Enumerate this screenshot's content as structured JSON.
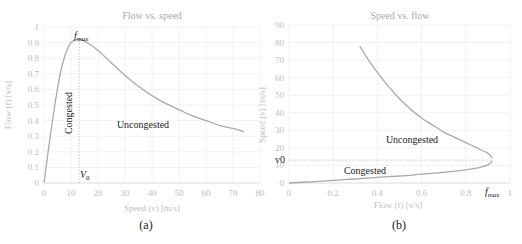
{
  "chart_data": [
    {
      "id": "a",
      "type": "line",
      "title": "Flow vs. speed",
      "xlabel": "Speed (v) [m/s]",
      "ylabel": "Flow (f) [v/s]",
      "subplot_label": "(a)",
      "xlim": [
        0,
        80
      ],
      "ylim": [
        0,
        1
      ],
      "xticks": [
        "0",
        "10",
        "20",
        "30",
        "40",
        "50",
        "60",
        "70",
        "80"
      ],
      "yticks": [
        "0",
        "0.1",
        "0.2",
        "0.3",
        "0.4",
        "0.5",
        "0.6",
        "0.7",
        "0.8",
        "0.9",
        "1"
      ],
      "grid": true,
      "series": [
        {
          "name": "flow",
          "x": [
            0,
            2,
            4,
            6,
            8,
            10,
            12,
            13,
            14,
            16,
            20,
            25,
            30,
            35,
            40,
            45,
            50,
            55,
            60,
            65,
            70,
            74
          ],
          "y": [
            0,
            0.26,
            0.5,
            0.7,
            0.83,
            0.9,
            0.92,
            0.92,
            0.918,
            0.9,
            0.85,
            0.77,
            0.69,
            0.62,
            0.56,
            0.51,
            0.47,
            0.43,
            0.4,
            0.37,
            0.35,
            0.33
          ]
        }
      ],
      "annotations": [
        {
          "text": "f",
          "sub": "max",
          "x": 13,
          "y": 0.92
        },
        {
          "text": "V",
          "sub": "0",
          "x": 13,
          "y": 0.04
        },
        {
          "text": "Congested",
          "rotated": true,
          "x": 9,
          "y": 0.45
        },
        {
          "text": "Uncongested",
          "x": 35,
          "y": 0.4
        }
      ],
      "guide_line": {
        "x": 13,
        "from_y": 0,
        "to_y": 0.92
      }
    },
    {
      "id": "b",
      "type": "line",
      "title": "Speed vs. flow",
      "xlabel": "Flow (f) [v/s]",
      "ylabel": "Speed (v) [m/s]",
      "subplot_label": "(b)",
      "xlim": [
        0,
        1
      ],
      "ylim": [
        0,
        90
      ],
      "xticks": [
        "0",
        "0.2",
        "0.4",
        "0.6",
        "0.8",
        "1"
      ],
      "yticks": [
        "0",
        "10",
        "20",
        "30",
        "40",
        "50",
        "60",
        "70",
        "80",
        "90"
      ],
      "grid": true,
      "series": [
        {
          "name": "uncongested",
          "x": [
            0.32,
            0.36,
            0.4,
            0.45,
            0.5,
            0.55,
            0.6,
            0.65,
            0.7,
            0.75,
            0.8,
            0.85,
            0.9,
            0.92
          ],
          "y": [
            78,
            70,
            63,
            55,
            48,
            42,
            37,
            33,
            29,
            26,
            23,
            20,
            17,
            14
          ]
        },
        {
          "name": "congested",
          "x": [
            0,
            0.1,
            0.2,
            0.3,
            0.4,
            0.5,
            0.6,
            0.7,
            0.8,
            0.86,
            0.9,
            0.92
          ],
          "y": [
            0,
            0.7,
            1.5,
            2.3,
            3.2,
            4.0,
            5.0,
            6.1,
            7.5,
            8.8,
            10.3,
            12.5
          ]
        }
      ],
      "annotations": [
        {
          "text": "Uncongested",
          "x": 0.48,
          "y": 21
        },
        {
          "text": "Congested",
          "x": 0.38,
          "y": 3
        },
        {
          "text": "v0",
          "axis": "y",
          "y": 13
        },
        {
          "text": "f",
          "sub": "max",
          "axis": "x",
          "x": 0.92
        }
      ],
      "guide_line": {
        "y": 13,
        "from_x": 0,
        "to_x": 0.92
      }
    }
  ]
}
